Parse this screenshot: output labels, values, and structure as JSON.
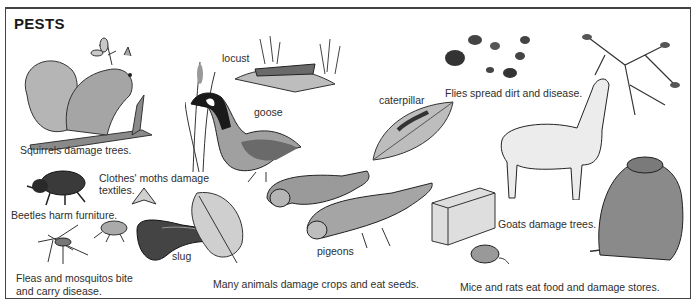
{
  "title": "PESTS",
  "captions": {
    "squirrels": "Squirrels damage trees.",
    "moths_line1": "Clothes' moths damage",
    "moths_line2": "textiles.",
    "beetles": "Beetles harm furniture.",
    "fleas_line1": "Fleas and mosquitos bite",
    "fleas_line2": "and carry disease.",
    "crops": "Many animals damage crops and eat seeds.",
    "flies": "Flies spread dirt and disease.",
    "goats": "Goats damage trees.",
    "mice": "Mice and rats eat food and damage stores."
  },
  "labels": {
    "locust": "locust",
    "goose": "goose",
    "caterpillar": "caterpillar",
    "slug": "slug",
    "pigeons": "pigeons"
  },
  "colors": {
    "ink": "#2a2a2a",
    "fill_light": "#c9c9c9",
    "fill_mid": "#9a9a9a",
    "fill_dark": "#555555",
    "frame": "#444444"
  }
}
